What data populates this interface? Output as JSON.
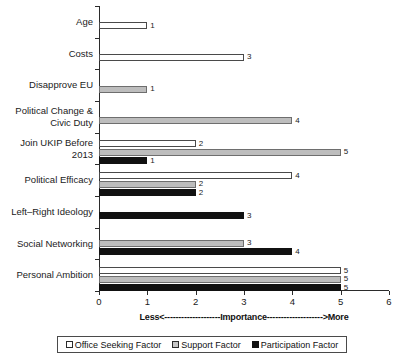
{
  "chart_data": {
    "type": "bar",
    "orientation": "horizontal",
    "title": "",
    "xlabel": "Less<--------------------Importance-------------------->More",
    "ylabel": "",
    "xlim": [
      0,
      6
    ],
    "xticks": [
      "0",
      "1",
      "2",
      "3",
      "4",
      "5",
      "6"
    ],
    "grid": false,
    "legend_position": "bottom",
    "categories": [
      "Age",
      "Costs",
      "Disapprove EU",
      "Political Change &\nCivic Duty",
      "Join UKIP Before\n2013",
      "Political Efficacy",
      "Left–Right Ideology",
      "Social Networking",
      "Personal Ambition"
    ],
    "series": [
      {
        "name": "Office Seeking Factor",
        "color": "#ffffff",
        "values": [
          1,
          3,
          null,
          null,
          2,
          4,
          null,
          null,
          5
        ]
      },
      {
        "name": "Support Factor",
        "color": "#bdbdbd",
        "values": [
          null,
          null,
          1,
          4,
          5,
          2,
          null,
          3,
          5
        ]
      },
      {
        "name": "Participation Factor",
        "color": "#111111",
        "values": [
          null,
          null,
          null,
          null,
          1,
          2,
          3,
          4,
          5
        ]
      }
    ]
  },
  "legend": {
    "items": [
      {
        "label": "Office Seeking Factor",
        "swatch": "office"
      },
      {
        "label": "Support Factor",
        "swatch": "support"
      },
      {
        "label": "Participation Factor",
        "swatch": "participation"
      }
    ]
  },
  "colors": {
    "office": "#ffffff",
    "support": "#bdbdbd",
    "participation": "#111111",
    "axis": "#2b2b2b",
    "text": "#1a1a1a"
  }
}
